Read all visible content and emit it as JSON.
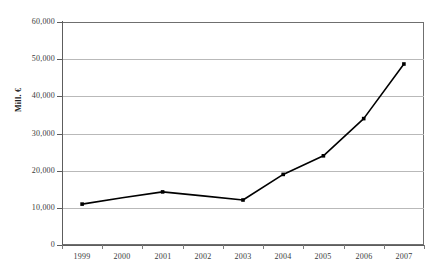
{
  "chart_data": {
    "type": "line",
    "title": "",
    "xlabel": "",
    "ylabel": "Mill. €",
    "ylim": [
      0,
      60000
    ],
    "ytick_step": 10000,
    "ytick_labels": [
      "0",
      "10,000",
      "20,000",
      "30,000",
      "40,000",
      "50,000",
      "60,000"
    ],
    "ytick_values": [
      0,
      10000,
      20000,
      30000,
      40000,
      50000,
      60000
    ],
    "grid": true,
    "grid_axis": "y",
    "legend": false,
    "legend_position": "none",
    "categories": [
      "1999",
      "2000",
      "2001",
      "2002",
      "2003",
      "2004",
      "2005",
      "2006",
      "2007"
    ],
    "x": [
      1999,
      2000,
      2001,
      2002,
      2003,
      2004,
      2005,
      2006,
      2007
    ],
    "values": [
      11000,
      12700,
      14300,
      13200,
      12100,
      19000,
      24000,
      34000,
      48700
    ],
    "series": [
      {
        "name": "Mill. €",
        "values": [
          11000,
          12700,
          14300,
          13200,
          12100,
          19000,
          24000,
          34000,
          48700
        ],
        "line_color": "#000000",
        "marker": "square",
        "marker_color": "#000000"
      }
    ],
    "markers_shown_at": [
      "1999",
      "2001",
      "2003",
      "2004",
      "2005",
      "2006",
      "2007"
    ],
    "colors": {
      "line": "#000000",
      "marker": "#000000",
      "gridline": "#b9b9b9",
      "axis": "#5d5d5d",
      "plot_border": "#6f6f6f",
      "background": "#ffffff",
      "tick_text": "#3a3a3a",
      "axis_title_text": "#222222"
    }
  }
}
